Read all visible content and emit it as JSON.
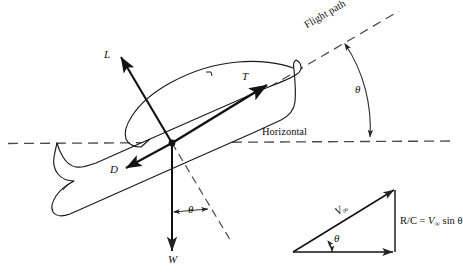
{
  "figure": {
    "type": "engineering-diagram",
    "background_color": "#ffffff",
    "line_color": "#1a1a1a",
    "width": 463,
    "height": 278
  },
  "labels": {
    "lift": "L",
    "thrust": "T",
    "drag": "D",
    "weight": "W",
    "flight_path": "Flight path",
    "horizontal": "Horizontal",
    "theta_flightpath": "θ",
    "theta_weight": "θ",
    "theta_triangle": "θ",
    "velocity": "V",
    "velocity_subscript": "∞",
    "rate_of_climb_formula": "R/C = V∞ sin θ",
    "rate_of_climb_prefix": "R/C = ",
    "rate_of_climb_symbol": "V",
    "rate_of_climb_sub": "∞",
    "rate_of_climb_suffix": " sin θ"
  },
  "geometry": {
    "center_of_gravity": {
      "x": 172,
      "y": 143
    },
    "horizontal_line": {
      "x1": 8,
      "y1": 143,
      "x2": 455,
      "y2": 141
    },
    "flight_path_line": {
      "x1": 140,
      "y1": 162,
      "x2": 400,
      "y2": 10
    },
    "climb_angle_degrees": 30
  },
  "vectors": [
    {
      "name": "lift",
      "label": "L",
      "from": {
        "x": 172,
        "y": 143
      },
      "to": {
        "x": 120,
        "y": 56
      }
    },
    {
      "name": "thrust",
      "label": "T",
      "from": {
        "x": 172,
        "y": 143
      },
      "to": {
        "x": 268,
        "y": 84
      }
    },
    {
      "name": "drag",
      "label": "D",
      "from": {
        "x": 172,
        "y": 143
      },
      "to": {
        "x": 125,
        "y": 168
      }
    },
    {
      "name": "weight",
      "label": "W",
      "from": {
        "x": 172,
        "y": 143
      },
      "to": {
        "x": 172,
        "y": 252
      }
    }
  ],
  "velocity_triangle": {
    "hypotenuse_label": "V∞",
    "vertical_label": "R/C = V∞ sin θ",
    "angle_label": "θ",
    "apex_left": {
      "x": 293,
      "y": 252
    },
    "apex_right": {
      "x": 395,
      "y": 190
    },
    "apex_base": {
      "x": 395,
      "y": 252
    }
  }
}
